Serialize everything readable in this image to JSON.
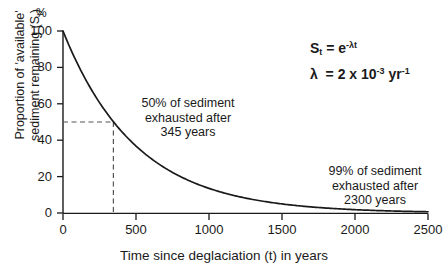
{
  "chart_data": {
    "type": "line",
    "title": "",
    "xlabel": "Time since deglaciation (t) in years",
    "ylabel_line1": "Proportion of 'available'",
    "ylabel_line2": "sediment remaining (S",
    "ylabel_sub": "t",
    "ylabel_close": ")",
    "yunit": "%",
    "xlim": [
      0,
      2500
    ],
    "ylim": [
      0,
      100
    ],
    "xticks": [
      0,
      500,
      1000,
      1500,
      2000,
      2500
    ],
    "xtick_labels": [
      "0",
      "500",
      "1000",
      "1500",
      "2000",
      "2500"
    ],
    "yticks": [
      0,
      20,
      40,
      60,
      80,
      100
    ],
    "ytick_labels": [
      "0",
      "20",
      "40",
      "60",
      "80",
      "100"
    ],
    "grid": false,
    "legend": "none",
    "series": [
      {
        "name": "St = e^(-lambda t)",
        "x": [
          0,
          100,
          200,
          300,
          345,
          400,
          500,
          600,
          700,
          800,
          900,
          1000,
          1100,
          1200,
          1300,
          1400,
          1500,
          1600,
          1700,
          1800,
          1900,
          2000,
          2100,
          2200,
          2300,
          2400,
          2500
        ],
        "values": [
          100.0,
          81.9,
          67.0,
          54.9,
          50.2,
          44.9,
          36.8,
          30.1,
          24.7,
          20.2,
          16.5,
          13.5,
          11.1,
          9.1,
          7.4,
          6.1,
          5.0,
          4.1,
          3.3,
          2.7,
          2.2,
          1.8,
          1.5,
          1.2,
          1.0,
          0.8,
          0.7
        ]
      }
    ],
    "guide_lines": [
      {
        "name": "half-life-horizontal",
        "orientation": "horizontal",
        "value": 50,
        "from_x": 0,
        "to_x": 345,
        "style": "dashed"
      },
      {
        "name": "half-life-vertical",
        "orientation": "vertical",
        "value": 345,
        "from_y": 0,
        "to_y": 50,
        "style": "dashed"
      }
    ],
    "annotations": [
      {
        "name": "annotation-50-percent",
        "lines": [
          "50% of sediment",
          "exhausted after",
          "345 years"
        ],
        "x": 345,
        "y": 50
      },
      {
        "name": "annotation-99-percent",
        "lines": [
          "99% of sediment",
          "exhausted after",
          "2300 years"
        ],
        "x": 2300,
        "y": 1
      }
    ],
    "equation": {
      "line1_base": "S",
      "line1_sub": "t",
      "line1_eq": " = e",
      "line1_exp": "-λt",
      "line2_base": "λ  = 2 x 10",
      "line2_exp": "-3",
      "line2_unit": " yr",
      "line2_unit_exp": "-1"
    },
    "colors": {
      "curve": "#1a1a1a",
      "axis": "#1a1a1a",
      "guide": "#666666",
      "background": "#ffffff",
      "text": "#1a1a1a"
    }
  }
}
